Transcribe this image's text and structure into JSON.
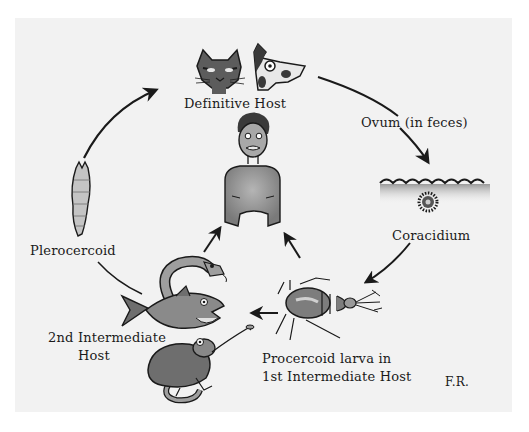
{
  "diagram": {
    "type": "life-cycle",
    "labels": {
      "definitive_host": "Definitive Host",
      "ovum": "Ovum (in feces)",
      "coracidium": "Coracidium",
      "procercoid_line1": "Procercoid larva in",
      "procercoid_line2": "1st Intermediate Host",
      "second_host_line1": "2nd Intermediate",
      "second_host_line2": "Host",
      "plerocercoid": "Plerocercoid",
      "signature": "F.R."
    },
    "stages": [
      {
        "id": "definitive-host",
        "label": "Definitive Host",
        "depicts": [
          "cat",
          "dog"
        ]
      },
      {
        "id": "ovum",
        "label": "Ovum (in feces)"
      },
      {
        "id": "coracidium",
        "label": "Coracidium",
        "depicts": [
          "water-surface",
          "ciliated-embryo"
        ]
      },
      {
        "id": "procercoid",
        "label": "Procercoid larva in 1st Intermediate Host",
        "depicts": [
          "copepod"
        ]
      },
      {
        "id": "second-intermediate-host",
        "label": "2nd Intermediate Host",
        "depicts": [
          "snake",
          "fish",
          "frog"
        ]
      },
      {
        "id": "plerocercoid",
        "label": "Plerocercoid",
        "depicts": [
          "larva"
        ]
      },
      {
        "id": "human",
        "label": "",
        "depicts": [
          "accidental-human-host"
        ]
      }
    ],
    "edges": [
      {
        "from": "definitive-host",
        "to": "ovum"
      },
      {
        "from": "ovum",
        "to": "coracidium"
      },
      {
        "from": "coracidium",
        "to": "procercoid"
      },
      {
        "from": "procercoid",
        "to": "second-intermediate-host"
      },
      {
        "from": "second-intermediate-host",
        "to": "plerocercoid"
      },
      {
        "from": "plerocercoid",
        "to": "definitive-host"
      },
      {
        "from": "second-intermediate-host",
        "to": "human"
      },
      {
        "from": "procercoid",
        "to": "human"
      }
    ],
    "colors": {
      "background": "#ffffff",
      "panel": "#f2f2f2",
      "ink": "#1a1a1a",
      "shade": "#8a8a8a"
    }
  }
}
